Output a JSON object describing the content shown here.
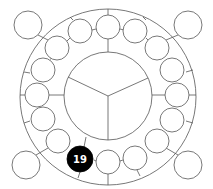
{
  "diagram": {
    "type": "ring-of-circles",
    "outer_ring": {
      "cx": 108,
      "cy": 97,
      "r": 88
    },
    "inner_circle": {
      "cx": 108,
      "cy": 96,
      "r": 44,
      "segments": 3
    },
    "highlighted_node": {
      "label": "19",
      "cx": 80,
      "cy": 159,
      "r": 13,
      "fill": "#000000"
    },
    "ring_nodes": [
      {
        "cx": 108,
        "cy": 27,
        "r": 12
      },
      {
        "cx": 135,
        "cy": 31,
        "r": 12
      },
      {
        "cx": 157,
        "cy": 48,
        "r": 12
      },
      {
        "cx": 172,
        "cy": 70,
        "r": 12
      },
      {
        "cx": 177,
        "cy": 95,
        "r": 12
      },
      {
        "cx": 172,
        "cy": 120,
        "r": 12
      },
      {
        "cx": 157,
        "cy": 141,
        "r": 12
      },
      {
        "cx": 135,
        "cy": 158,
        "r": 12
      },
      {
        "cx": 108,
        "cy": 162,
        "r": 12
      },
      {
        "cx": 58,
        "cy": 141,
        "r": 12
      },
      {
        "cx": 43,
        "cy": 119,
        "r": 12
      },
      {
        "cx": 37,
        "cy": 95,
        "r": 12
      },
      {
        "cx": 43,
        "cy": 70,
        "r": 12
      },
      {
        "cx": 57,
        "cy": 48,
        "r": 12
      },
      {
        "cx": 80,
        "cy": 31,
        "r": 12
      }
    ],
    "corner_nodes": [
      {
        "cx": 28,
        "cy": 25,
        "r": 14
      },
      {
        "cx": 188,
        "cy": 25,
        "r": 14
      },
      {
        "cx": 26,
        "cy": 165,
        "r": 14
      },
      {
        "cx": 188,
        "cy": 165,
        "r": 14
      }
    ],
    "colors": {
      "stroke": "#555555",
      "highlight": "#000000",
      "label": "#ffffff"
    }
  }
}
